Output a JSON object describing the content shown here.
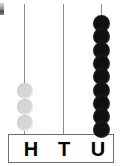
{
  "figure": {
    "corner_mark": "."
  },
  "columns": [
    {
      "id": "hundreds",
      "label": "H",
      "bead_count": 3,
      "bead_color": "#d6d6d6",
      "state": "inactive",
      "rod_x": 24,
      "label_x": 30
    },
    {
      "id": "tens",
      "label": "T",
      "bead_count": 0,
      "bead_color": "#d6d6d6",
      "state": "empty",
      "rod_x": 63,
      "label_x": 63
    },
    {
      "id": "units",
      "label": "U",
      "bead_count": 9,
      "bead_color": "#111111",
      "state": "active",
      "rod_x": 101,
      "label_x": 97
    }
  ],
  "chart_data": {
    "type": "bar",
    "categories": [
      "H",
      "T",
      "U"
    ],
    "values": [
      3,
      0,
      9
    ],
    "xlabel": "",
    "ylabel": "Beads",
    "ylim": [
      0,
      9
    ]
  },
  "colors": {
    "rod": "#8d8d8d",
    "box_border": "#6e6e6e",
    "bead_dark": "#111111",
    "bead_light": "#d6d6d6",
    "text": "#000000",
    "background": "#ffffff"
  },
  "geometry": {
    "rod_top": 4,
    "rod_bottom": 138,
    "bead_diameter_dark": 17,
    "bead_diameter_light": 16,
    "dark_stack_top": 15,
    "dark_bead_pitch": 13.3,
    "light_stack_top": 83,
    "light_bead_pitch": 16
  }
}
